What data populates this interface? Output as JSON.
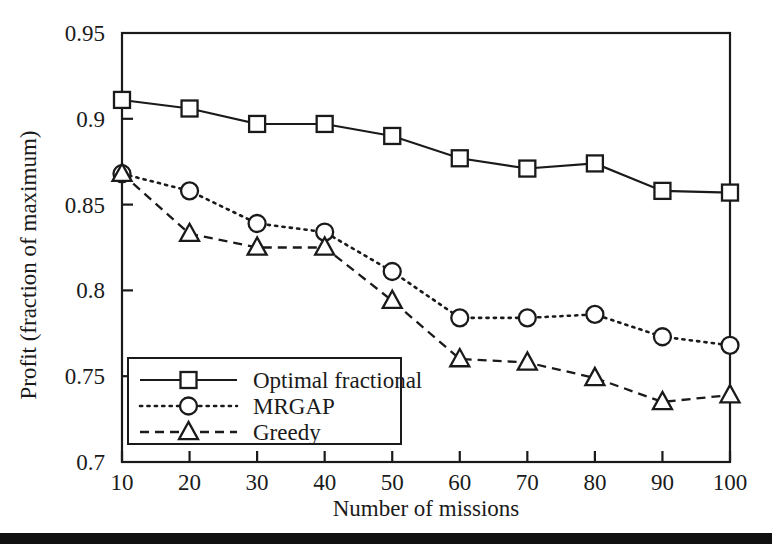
{
  "chart_data": {
    "type": "line",
    "title": "",
    "xlabel": "Number of missions",
    "ylabel": "Profit (fraction of maximum)",
    "x": [
      10,
      20,
      30,
      40,
      50,
      60,
      70,
      80,
      90,
      100
    ],
    "xticklabels": [
      "10",
      "20",
      "30",
      "40",
      "50",
      "60",
      "70",
      "80",
      "90",
      "100"
    ],
    "yticklabels": [
      "0.7",
      "0.75",
      "0.8",
      "0.85",
      "0.9",
      "0.95"
    ],
    "yticks": [
      0.7,
      0.75,
      0.8,
      0.85,
      0.9,
      0.95
    ],
    "xlim": [
      10,
      100
    ],
    "ylim": [
      0.7,
      0.95
    ],
    "grid": false,
    "legend_position": "lower left",
    "series": [
      {
        "name": "Optimal fractional",
        "marker": "square",
        "linestyle": "solid",
        "color": "#1a1a1a",
        "values": [
          0.911,
          0.906,
          0.897,
          0.897,
          0.89,
          0.877,
          0.871,
          0.874,
          0.858,
          0.857
        ]
      },
      {
        "name": "MRGAP",
        "marker": "circle",
        "linestyle": "dotted",
        "color": "#1a1a1a",
        "values": [
          0.868,
          0.858,
          0.839,
          0.834,
          0.811,
          0.784,
          0.784,
          0.786,
          0.773,
          0.768
        ]
      },
      {
        "name": "Greedy",
        "marker": "triangle",
        "linestyle": "dashed",
        "color": "#1a1a1a",
        "values": [
          0.868,
          0.833,
          0.825,
          0.825,
          0.794,
          0.76,
          0.758,
          0.749,
          0.735,
          0.739
        ]
      }
    ]
  },
  "figure": {
    "background_color": "#ffffff",
    "ink_color": "#1a1a1a",
    "footer_rule_color": "#111111"
  }
}
